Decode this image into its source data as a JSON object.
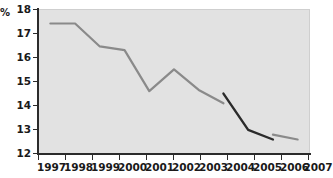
{
  "chart_data": {
    "type": "line",
    "title": "",
    "xlabel": "",
    "ylabel": "%",
    "ylim": [
      12,
      18
    ],
    "yticks": [
      12,
      13,
      14,
      15,
      16,
      17,
      18
    ],
    "grid": false,
    "legend": "none",
    "categories": [
      "1997",
      "1998",
      "1999",
      "2000",
      "2001",
      "2002",
      "2003",
      "2004",
      "2005",
      "2006",
      "2007"
    ],
    "series": [
      {
        "name": "grey-line",
        "color": "#8a8a8a",
        "x": [
          "1997",
          "1998",
          "1999",
          "2000",
          "2001",
          "2002",
          "2003",
          "2004"
        ],
        "values": [
          17.4,
          17.4,
          16.45,
          16.3,
          14.6,
          15.5,
          14.65,
          14.1
        ]
      },
      {
        "name": "grey-line-tail",
        "color": "#8a8a8a",
        "x": [
          "2006",
          "2007"
        ],
        "values": [
          12.8,
          12.6
        ]
      },
      {
        "name": "dark-line",
        "color": "#2b2b2b",
        "x": [
          "2004",
          "2005",
          "2006"
        ],
        "values": [
          14.5,
          13.0,
          12.6
        ]
      }
    ]
  },
  "axis": {
    "y_unit": "%",
    "y_tick_labels": [
      "18",
      "17",
      "16",
      "15",
      "14",
      "13",
      "12"
    ],
    "x_tick_labels": [
      "1997",
      "1998",
      "1999",
      "2000",
      "2001",
      "2002",
      "2003",
      "2004",
      "2005",
      "2006",
      "2007"
    ]
  },
  "colors": {
    "plot_background": "#e2e2e2",
    "page_background": "#ffffff",
    "axis": "#2b2b2b",
    "series_grey": "#8a8a8a",
    "series_dark": "#2b2b2b",
    "text": "#1a1a1a"
  }
}
